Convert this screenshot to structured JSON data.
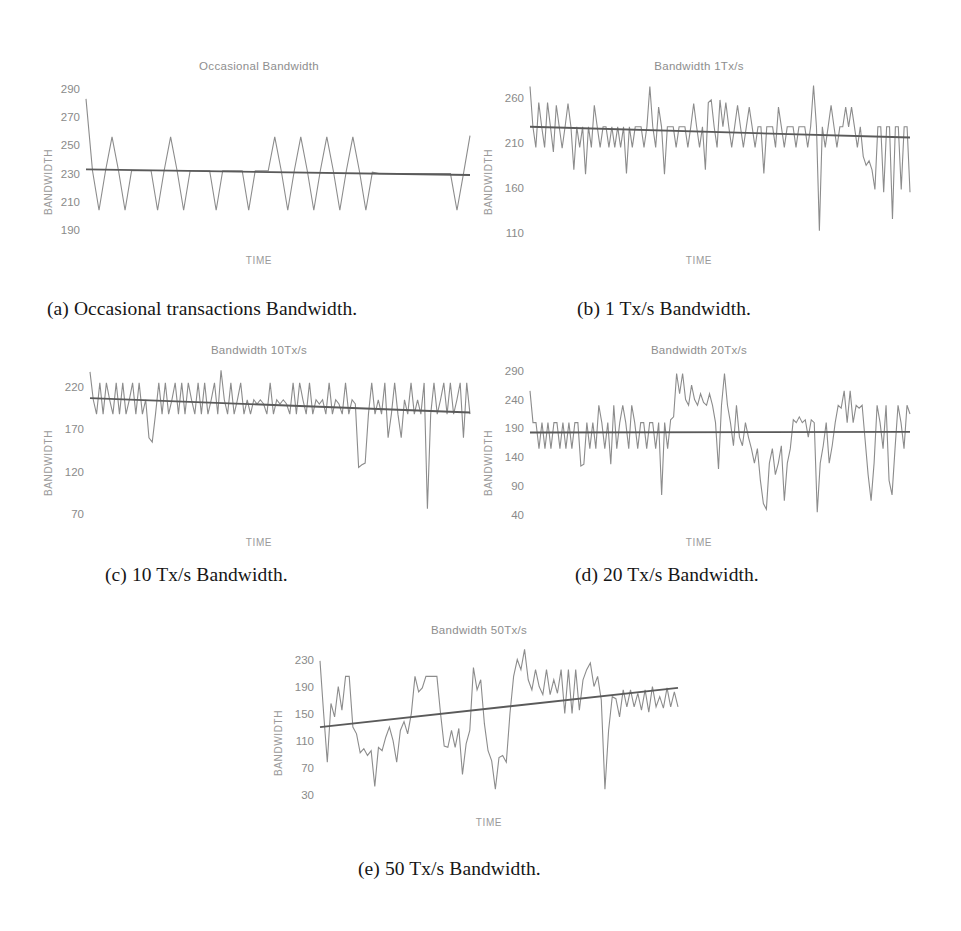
{
  "figure": {
    "panels": [
      {
        "id": "a",
        "title": "Occasional Bandwidth",
        "xlabel": "TIME",
        "ylabel": "BANDWIDTH",
        "caption": "(a) Occasional transactions Bandwidth.",
        "yticks": [
          290,
          270,
          250,
          230,
          210,
          190
        ]
      },
      {
        "id": "b",
        "title": "Bandwidth 1Tx/s",
        "xlabel": "TIME",
        "ylabel": "BANDWIDTH",
        "caption": "(b) 1 Tx/s Bandwidth.",
        "yticks": [
          260,
          210,
          160,
          110
        ]
      },
      {
        "id": "c",
        "title": "Bandwidth 10Tx/s",
        "xlabel": "TIME",
        "ylabel": "BANDWIDTH",
        "caption": "(c) 10 Tx/s Bandwidth.",
        "yticks": [
          220,
          170,
          120,
          70
        ]
      },
      {
        "id": "d",
        "title": "Bandwidth 20Tx/s",
        "xlabel": "TIME",
        "ylabel": "BANDWIDTH",
        "caption": "(d) 20 Tx/s Bandwidth.",
        "yticks": [
          290,
          240,
          190,
          140,
          90,
          40
        ]
      },
      {
        "id": "e",
        "title": "Bandwidth 50Tx/s",
        "xlabel": "TIME",
        "ylabel": "BANDWIDTH",
        "caption": "(e) 50 Tx/s Bandwidth.",
        "yticks": [
          230,
          190,
          150,
          110,
          70,
          30
        ]
      }
    ],
    "colors": {
      "data_line": "#8c8c8c",
      "trend_line": "#5a5a5a",
      "title_text": "#8e8e8e",
      "tick_text": "#8a8a8a",
      "caption_text": "#161616",
      "background": "#ffffff"
    }
  },
  "chart_data": [
    {
      "id": "a",
      "type": "line",
      "title": "Occasional Bandwidth",
      "xlabel": "TIME",
      "ylabel": "BANDWIDTH",
      "ylim": [
        185,
        295
      ],
      "yticks": [
        190,
        210,
        230,
        250,
        270,
        290
      ],
      "grid": false,
      "legend": "none",
      "series": [
        {
          "name": "Bandwidth",
          "values": [
            283,
            232,
            204,
            232,
            256,
            232,
            204,
            232,
            232,
            232,
            232,
            204,
            232,
            256,
            232,
            204,
            232,
            232,
            232,
            232,
            204,
            232,
            232,
            232,
            232,
            204,
            232,
            232,
            232,
            256,
            232,
            204,
            232,
            256,
            232,
            204,
            232,
            256,
            232,
            204,
            232,
            256,
            232,
            204,
            231,
            230,
            230,
            230,
            230,
            230,
            230,
            230,
            230,
            230,
            230,
            230,
            230,
            204,
            230,
            257
          ]
        },
        {
          "name": "Trend",
          "type": "trend",
          "values": [
            233,
            229
          ]
        }
      ]
    },
    {
      "id": "b",
      "type": "line",
      "title": "Bandwidth 1Tx/s",
      "xlabel": "TIME",
      "ylabel": "BANDWIDTH",
      "ylim": [
        105,
        278
      ],
      "yticks": [
        110,
        160,
        210,
        260
      ],
      "grid": false,
      "legend": "none",
      "series": [
        {
          "name": "Bandwidth",
          "values": [
            273,
            228,
            205,
            255,
            228,
            205,
            255,
            228,
            200,
            252,
            228,
            204,
            228,
            254,
            228,
            180,
            228,
            205,
            228,
            175,
            228,
            205,
            252,
            228,
            205,
            228,
            228,
            205,
            228,
            205,
            228,
            205,
            228,
            176,
            228,
            205,
            228,
            228,
            228,
            205,
            228,
            273,
            228,
            205,
            250,
            228,
            175,
            228,
            228,
            228,
            205,
            228,
            228,
            228,
            205,
            228,
            254,
            228,
            205,
            228,
            180,
            255,
            258,
            228,
            205,
            258,
            228,
            255,
            228,
            205,
            228,
            252,
            228,
            205,
            228,
            250,
            228,
            205,
            228,
            228,
            176,
            228,
            228,
            228,
            205,
            250,
            228,
            205,
            228,
            228,
            228,
            205,
            228,
            228,
            228,
            205,
            228,
            274,
            228,
            112,
            228,
            205,
            228,
            252,
            228,
            205,
            228,
            228,
            250,
            228,
            250,
            228,
            205,
            228,
            195,
            185,
            190,
            180,
            158,
            228,
            228,
            155,
            228,
            228,
            125,
            228,
            228,
            158,
            228,
            228,
            155
          ]
        },
        {
          "name": "Trend",
          "type": "trend",
          "values": [
            228,
            216
          ]
        }
      ]
    },
    {
      "id": "c",
      "type": "line",
      "title": "Bandwidth 10Tx/s",
      "xlabel": "TIME",
      "ylabel": "BANDWIDTH",
      "ylim": [
        65,
        245
      ],
      "yticks": [
        70,
        120,
        170,
        220
      ],
      "grid": false,
      "legend": "none",
      "series": [
        {
          "name": "Bandwidth",
          "values": [
            238,
            205,
            188,
            225,
            188,
            225,
            205,
            188,
            225,
            188,
            225,
            188,
            205,
            225,
            188,
            225,
            188,
            205,
            160,
            155,
            188,
            225,
            188,
            225,
            188,
            205,
            225,
            188,
            225,
            188,
            225,
            205,
            188,
            225,
            188,
            225,
            188,
            205,
            225,
            188,
            240,
            205,
            188,
            225,
            188,
            205,
            225,
            188,
            205,
            188,
            205,
            200,
            205,
            200,
            188,
            225,
            188,
            205,
            200,
            205,
            200,
            188,
            225,
            188,
            225,
            205,
            188,
            225,
            188,
            205,
            200,
            205,
            188,
            225,
            188,
            205,
            200,
            188,
            225,
            188,
            205,
            200,
            125,
            128,
            130,
            188,
            225,
            188,
            205,
            188,
            225,
            160,
            188,
            225,
            188,
            160,
            205,
            188,
            225,
            188,
            205,
            188,
            225,
            76,
            188,
            225,
            188,
            205,
            225,
            188,
            225,
            188,
            205,
            225,
            160,
            225,
            188
          ]
        },
        {
          "name": "Trend",
          "type": "trend",
          "values": [
            207,
            190
          ]
        }
      ]
    },
    {
      "id": "d",
      "type": "line",
      "title": "Bandwidth 20Tx/s",
      "xlabel": "TIME",
      "ylabel": "BANDWIDTH",
      "ylim": [
        35,
        298
      ],
      "yticks": [
        40,
        90,
        140,
        190,
        240,
        290
      ],
      "grid": false,
      "legend": "none",
      "series": [
        {
          "name": "Bandwidth",
          "values": [
            255,
            200,
            200,
            155,
            200,
            155,
            200,
            155,
            200,
            200,
            155,
            200,
            155,
            200,
            155,
            200,
            200,
            125,
            128,
            200,
            155,
            200,
            155,
            230,
            200,
            155,
            200,
            128,
            230,
            155,
            200,
            230,
            200,
            155,
            230,
            200,
            155,
            200,
            200,
            155,
            200,
            200,
            155,
            200,
            75,
            200,
            155,
            205,
            210,
            285,
            250,
            285,
            240,
            230,
            265,
            240,
            230,
            250,
            235,
            230,
            250,
            230,
            200,
            120,
            230,
            285,
            230,
            200,
            160,
            230,
            175,
            160,
            200,
            175,
            155,
            130,
            155,
            100,
            60,
            50,
            130,
            155,
            110,
            130,
            160,
            65,
            130,
            155,
            205,
            200,
            210,
            200,
            205,
            175,
            205,
            200,
            45,
            130,
            160,
            200,
            130,
            160,
            200,
            230,
            225,
            255,
            200,
            255,
            200,
            230,
            225,
            230,
            170,
            110,
            65,
            130,
            230,
            200,
            155,
            230,
            100,
            75,
            155,
            230,
            200,
            155,
            230,
            215
          ]
        },
        {
          "name": "Trend",
          "type": "trend",
          "values": [
            183,
            184
          ]
        }
      ]
    },
    {
      "id": "e",
      "type": "line",
      "title": "Bandwidth 50Tx/s",
      "xlabel": "TIME",
      "ylabel": "BANDWIDTH",
      "ylim": [
        25,
        250
      ],
      "yticks": [
        30,
        70,
        110,
        150,
        190,
        230
      ],
      "grid": false,
      "legend": "none",
      "series": [
        {
          "name": "Bandwidth",
          "values": [
            228,
            150,
            78,
            165,
            145,
            190,
            155,
            205,
            205,
            130,
            120,
            92,
            98,
            88,
            95,
            42,
            100,
            95,
            115,
            130,
            110,
            78,
            125,
            138,
            120,
            150,
            205,
            182,
            188,
            205,
            205,
            205,
            205,
            150,
            102,
            100,
            125,
            100,
            128,
            60,
            105,
            125,
            218,
            185,
            200,
            135,
            95,
            80,
            38,
            85,
            88,
            78,
            150,
            205,
            230,
            215,
            245,
            200,
            185,
            215,
            190,
            178,
            215,
            178,
            200,
            180,
            215,
            150,
            215,
            150,
            215,
            155,
            200,
            215,
            225,
            190,
            205,
            170,
            38,
            125,
            175,
            172,
            145,
            185,
            160,
            185,
            160,
            180,
            155,
            185,
            152,
            190,
            160,
            175,
            158,
            188,
            160,
            182,
            160
          ]
        },
        {
          "name": "Trend",
          "type": "trend",
          "values": [
            130,
            188
          ]
        }
      ]
    }
  ]
}
